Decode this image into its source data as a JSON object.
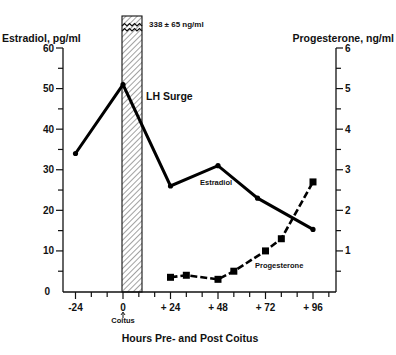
{
  "chart_data": {
    "type": "line",
    "title": "",
    "xlabel": "Hours Pre- and Post Coitus",
    "ylabel_left": "Estradiol, pg/ml",
    "ylabel_right": "Progesterone, ng/ml",
    "x_ticks": [
      -24,
      0,
      24,
      48,
      72,
      96
    ],
    "x_tick_labels": [
      "-24",
      "0",
      "+ 24",
      "+ 48",
      "+ 72",
      "+ 96"
    ],
    "x_range": [
      -32,
      112
    ],
    "y_left_ticks": [
      0,
      10,
      20,
      30,
      40,
      50,
      60
    ],
    "y_left_range": [
      0,
      60
    ],
    "y_right_ticks": [
      1,
      2,
      3,
      4,
      5,
      6
    ],
    "y_right_range": [
      0,
      6
    ],
    "grid": false,
    "series": [
      {
        "name": "Estradiol",
        "axis": "left",
        "style": "solid",
        "marker": "dot",
        "x": [
          -24,
          0,
          24,
          48,
          68,
          96
        ],
        "values": [
          34,
          51,
          26,
          31,
          23,
          15.3
        ]
      },
      {
        "name": "Progesterone",
        "axis": "right",
        "style": "dashed",
        "marker": "square",
        "x": [
          24,
          32,
          48,
          56,
          72,
          80,
          96
        ],
        "values": [
          0.35,
          0.4,
          0.3,
          0.5,
          1.0,
          1.3,
          2.7
        ]
      }
    ],
    "annotations": [
      {
        "text": "LH Surge",
        "type": "shaded-bar",
        "x_start": 0,
        "x_end": 10,
        "peak_value": "338 ± 65 ng/ml"
      },
      {
        "text": "Coitus",
        "x": 0,
        "type": "arrow-label"
      }
    ]
  },
  "labels": {
    "y_left_title": "Estradiol, pg/ml",
    "y_right_title": "Progesterone, ng/ml",
    "x_title": "Hours Pre- and Post Coitus",
    "lh_surge": "LH Surge",
    "lh_peak": "338 ± 65 ng/ml",
    "coitus": "Coitus",
    "estradiol_series": "Estradiol",
    "progesterone_series": "Progesterone"
  }
}
